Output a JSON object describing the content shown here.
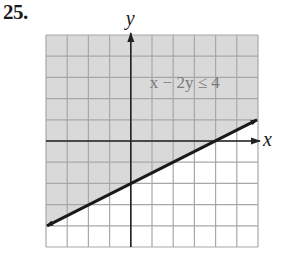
{
  "problem": {
    "number": "25."
  },
  "colors": {
    "shade": "#d9d9d9",
    "grid": "#a8a8a8",
    "axis": "#222222",
    "boundary": "#1a1a1a",
    "label_text": "#7a7a7a"
  },
  "chart_data": {
    "type": "line",
    "title": "",
    "xlabel": "x",
    "ylabel": "y",
    "xlim": [
      -4,
      6
    ],
    "ylim": [
      -5,
      5
    ],
    "grid": true,
    "grid_step": 1,
    "tick_labels": false,
    "annotations": [
      {
        "text": "x − 2y ≤ 4",
        "x": 3,
        "y": 2.8
      }
    ],
    "series": [
      {
        "name": "x − 2y = 4",
        "equation": "y = x/2 − 2",
        "style": "solid",
        "arrows": "both",
        "x": [
          -4,
          6
        ],
        "y": [
          -4,
          1
        ]
      }
    ],
    "shading": {
      "region": "above boundary line",
      "inequality": "x − 2y ≤ 4"
    },
    "key_points": {
      "x_intercept": [
        4,
        0
      ],
      "y_intercept": [
        0,
        -2
      ]
    }
  }
}
